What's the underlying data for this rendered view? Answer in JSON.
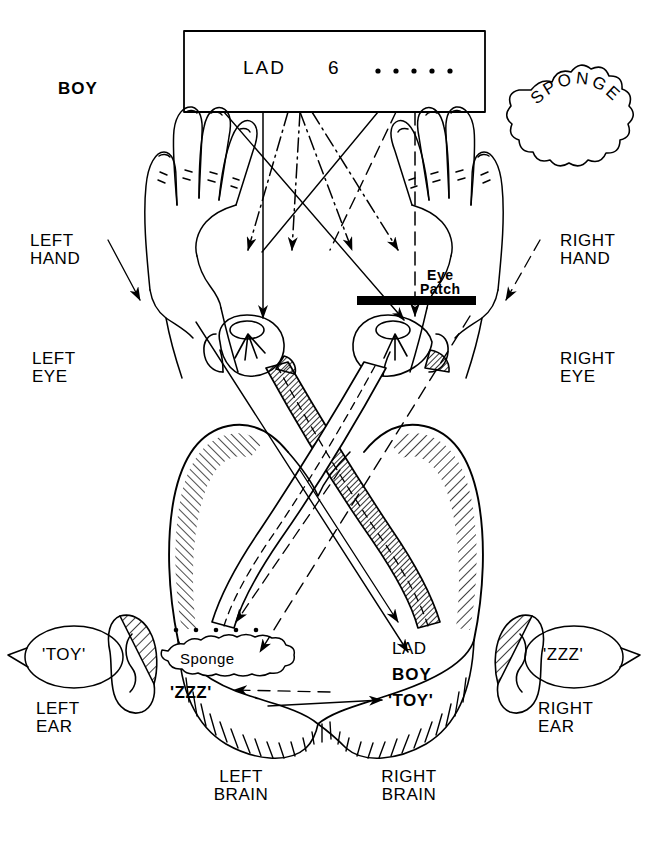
{
  "figure": {
    "stimulus_box": {
      "word_left": "LAD",
      "digit_center": "6",
      "dots_right": "· · · · ·"
    },
    "hands": {
      "left": {
        "object_label": "BOY",
        "label": "LEFT\nHAND"
      },
      "right": {
        "object_label": "SPONGE",
        "label": "RIGHT\nHAND"
      }
    },
    "eyes": {
      "left_label": "LEFT\nEYE",
      "right_label": "RIGHT\nEYE",
      "patch_label": "Eye\nPatch"
    },
    "ears": {
      "left_bubble": "'TOY'",
      "left_label": "LEFT\nEAR",
      "right_bubble": "'ZZZ'",
      "right_label": "RIGHT\nEAR"
    },
    "brain": {
      "left_label": "LEFT\nBRAIN",
      "right_label": "RIGHT\nBRAIN",
      "left_contents": {
        "dots": "· · · · ·",
        "object": "Sponge",
        "sound": "'ZZZ'"
      },
      "right_contents": {
        "word": "LAD",
        "object": "BOY",
        "sound": "'TOY'"
      }
    },
    "colors": {
      "ink": "#000000",
      "paper": "#ffffff",
      "patch": "#000000"
    }
  }
}
